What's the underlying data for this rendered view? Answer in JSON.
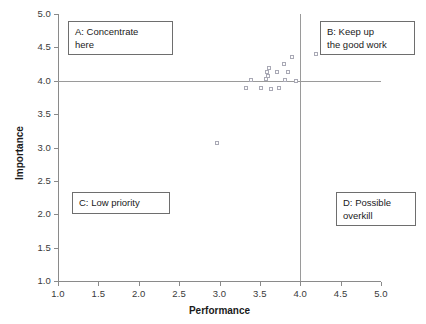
{
  "chart_data": {
    "type": "scatter",
    "title": "",
    "xlabel": "Performance",
    "ylabel": "Importance",
    "xlim": [
      1.0,
      5.0
    ],
    "ylim": [
      1.0,
      5.0
    ],
    "xticks": [
      "1.0",
      "1.5",
      "2.0",
      "2.5",
      "3.0",
      "3.5",
      "4.0",
      "4.5",
      "5.0"
    ],
    "yticks": [
      "1.0",
      "1.5",
      "2.0",
      "2.5",
      "3.0",
      "3.5",
      "4.0",
      "4.5",
      "5.0"
    ],
    "grid": false,
    "legend": "none",
    "marker_style": "open-square",
    "marker_color": "#a9a9b5",
    "reference_lines": [
      {
        "axis": "vertical",
        "value": 4.0,
        "color": "#9a9a9a"
      },
      {
        "axis": "horizontal",
        "value": 4.0,
        "color": "#9a9a9a"
      }
    ],
    "points": [
      {
        "x": 2.97,
        "y": 3.06
      },
      {
        "x": 3.34,
        "y": 3.88
      },
      {
        "x": 3.4,
        "y": 4.0
      },
      {
        "x": 3.52,
        "y": 3.88
      },
      {
        "x": 3.58,
        "y": 4.02
      },
      {
        "x": 3.6,
        "y": 4.12
      },
      {
        "x": 3.61,
        "y": 4.07
      },
      {
        "x": 3.62,
        "y": 4.18
      },
      {
        "x": 3.64,
        "y": 3.87
      },
      {
        "x": 3.72,
        "y": 4.12
      },
      {
        "x": 3.74,
        "y": 3.88
      },
      {
        "x": 3.8,
        "y": 4.25
      },
      {
        "x": 3.82,
        "y": 4.0
      },
      {
        "x": 3.86,
        "y": 4.13
      },
      {
        "x": 3.9,
        "y": 4.35
      },
      {
        "x": 3.95,
        "y": 3.99
      },
      {
        "x": 4.2,
        "y": 4.4
      }
    ],
    "quadrants": [
      {
        "id": "A",
        "label": "A: Concentrate here",
        "position": "top-left"
      },
      {
        "id": "B",
        "label": "B: Keep up the good work",
        "position": "top-right"
      },
      {
        "id": "C",
        "label": "C: Low priority",
        "position": "bottom-left"
      },
      {
        "id": "D",
        "label": "D: Possible overkill",
        "position": "bottom-right"
      }
    ]
  },
  "quadrant_text": {
    "a_line1": "A: Concentrate",
    "a_line2": "here",
    "b_line1": "B: Keep up",
    "b_line2": "the good work",
    "c_line1": "C: Low priority",
    "d_line1": "D: Possible",
    "d_line2": "overkill"
  }
}
